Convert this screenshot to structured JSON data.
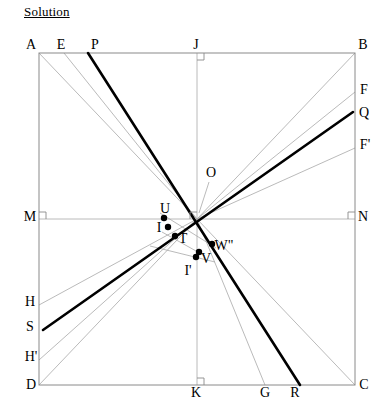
{
  "title": "Solution",
  "figure": {
    "width": 391,
    "height": 417,
    "colors": {
      "thick_line": "#000000",
      "thin_line": "#a8a8a8",
      "square_edge": "#8a8a8a",
      "point_fill": "#000000",
      "label_text": "#000000"
    },
    "square": {
      "name": "ABCD",
      "left": 39,
      "top": 53,
      "right": 355,
      "bottom": 385
    },
    "labels": [
      {
        "text": "A",
        "x": 31,
        "y": 45,
        "name": "label-A"
      },
      {
        "text": "E",
        "x": 61,
        "y": 45,
        "name": "label-E"
      },
      {
        "text": "P",
        "x": 95,
        "y": 45,
        "name": "label-P"
      },
      {
        "text": "J",
        "x": 196,
        "y": 45,
        "name": "label-J"
      },
      {
        "text": "B",
        "x": 363,
        "y": 45,
        "name": "label-B"
      },
      {
        "text": "F",
        "x": 364,
        "y": 90,
        "name": "label-F"
      },
      {
        "text": "Q",
        "x": 364,
        "y": 113,
        "name": "label-Q"
      },
      {
        "text": "F'",
        "x": 365,
        "y": 145,
        "name": "label-F-prime"
      },
      {
        "text": "O",
        "x": 211,
        "y": 173,
        "name": "label-O"
      },
      {
        "text": "M",
        "x": 30,
        "y": 217,
        "name": "label-M"
      },
      {
        "text": "N",
        "x": 363,
        "y": 217,
        "name": "label-N"
      },
      {
        "text": "U",
        "x": 165,
        "y": 209,
        "name": "label-U"
      },
      {
        "text": "I",
        "x": 159,
        "y": 228,
        "name": "label-I"
      },
      {
        "text": "T",
        "x": 183,
        "y": 239,
        "name": "label-T"
      },
      {
        "text": "W\"",
        "x": 224,
        "y": 246,
        "name": "label-W-dprime"
      },
      {
        "text": "V",
        "x": 206,
        "y": 259,
        "name": "label-V"
      },
      {
        "text": "I'",
        "x": 188,
        "y": 271,
        "name": "label-I-prime"
      },
      {
        "text": "H",
        "x": 30,
        "y": 302,
        "name": "label-H"
      },
      {
        "text": "S",
        "x": 30,
        "y": 327,
        "name": "label-S"
      },
      {
        "text": "H'",
        "x": 31,
        "y": 357,
        "name": "label-H-prime"
      },
      {
        "text": "D",
        "x": 31,
        "y": 385,
        "name": "label-D"
      },
      {
        "text": "K",
        "x": 196,
        "y": 393,
        "name": "label-K"
      },
      {
        "text": "G",
        "x": 265,
        "y": 393,
        "name": "label-G"
      },
      {
        "text": "R",
        "x": 295,
        "y": 393,
        "name": "label-R"
      },
      {
        "text": "C",
        "x": 364,
        "y": 385,
        "name": "label-C"
      }
    ],
    "points": [
      {
        "name": "point-U",
        "label": "U",
        "x": 164,
        "y": 218,
        "r": 3.2
      },
      {
        "name": "point-I",
        "label": "I",
        "x": 168,
        "y": 227,
        "r": 3.2
      },
      {
        "name": "point-T",
        "label": "T",
        "x": 175,
        "y": 236,
        "r": 3.2
      },
      {
        "name": "point-I-prime",
        "label": "I'",
        "x": 196,
        "y": 257,
        "r": 3.2
      },
      {
        "name": "point-V",
        "label": "V",
        "x": 199,
        "y": 252,
        "r": 3.2
      },
      {
        "name": "point-W-dprime",
        "label": "W\"",
        "x": 212,
        "y": 244,
        "r": 3.2
      }
    ],
    "thin_segments": [
      {
        "name": "segment-A-to-center",
        "x1": 39,
        "y1": 53,
        "x2": 197,
        "y2": 219
      },
      {
        "name": "segment-E-to-center",
        "x1": 64,
        "y1": 53,
        "x2": 197,
        "y2": 219
      },
      {
        "name": "segment-center-to-B",
        "x1": 197,
        "y1": 219,
        "x2": 355,
        "y2": 53
      },
      {
        "name": "segment-center-to-F",
        "x1": 197,
        "y1": 219,
        "x2": 355,
        "y2": 92
      },
      {
        "name": "segment-center-to-Fp",
        "x1": 197,
        "y1": 219,
        "x2": 355,
        "y2": 148
      },
      {
        "name": "segment-center-to-C",
        "x1": 197,
        "y1": 219,
        "x2": 355,
        "y2": 385
      },
      {
        "name": "segment-center-to-G",
        "x1": 197,
        "y1": 219,
        "x2": 265,
        "y2": 385
      },
      {
        "name": "segment-D-to-center",
        "x1": 39,
        "y1": 385,
        "x2": 197,
        "y2": 219
      },
      {
        "name": "segment-Hp-to-center",
        "x1": 39,
        "y1": 360,
        "x2": 197,
        "y2": 219
      },
      {
        "name": "segment-H-to-center",
        "x1": 39,
        "y1": 305,
        "x2": 197,
        "y2": 219
      },
      {
        "name": "segment-M-to-N",
        "x1": 39,
        "y1": 219,
        "x2": 355,
        "y2": 219
      },
      {
        "name": "segment-J-to-K",
        "x1": 197,
        "y1": 53,
        "x2": 197,
        "y2": 385
      },
      {
        "name": "segment-U-to-Wdprime",
        "x1": 160,
        "y1": 213,
        "x2": 216,
        "y2": 248
      },
      {
        "name": "segment-I-to-V",
        "x1": 162,
        "y1": 232,
        "x2": 205,
        "y2": 256
      },
      {
        "name": "segment-T-to-Iprime",
        "x1": 150,
        "y1": 246,
        "x2": 215,
        "y2": 262
      }
    ],
    "thick_segments": [
      {
        "name": "segment-P-to-R",
        "x1": 88,
        "y1": 53,
        "x2": 300,
        "y2": 385
      },
      {
        "name": "segment-S-to-Q",
        "x1": 43,
        "y1": 330,
        "x2": 353,
        "y2": 112
      }
    ],
    "right_angle_marks": [
      {
        "name": "right-angle-at-J",
        "x": 197,
        "y": 53,
        "dx": 1,
        "dy": 1
      },
      {
        "name": "right-angle-at-M",
        "x": 39,
        "y": 219,
        "dx": 1,
        "dy": -1
      },
      {
        "name": "right-angle-at-N",
        "x": 355,
        "y": 219,
        "dx": -1,
        "dy": -1
      },
      {
        "name": "right-angle-at-K",
        "x": 197,
        "y": 385,
        "dx": 1,
        "dy": -1
      },
      {
        "name": "right-angle-at-O",
        "x": 197,
        "y": 219,
        "dx": -1,
        "dy": -1
      }
    ],
    "leader_lines": [
      {
        "name": "leader-O-to-center",
        "x1": 209,
        "y1": 182,
        "x2": 199,
        "y2": 213
      }
    ]
  }
}
